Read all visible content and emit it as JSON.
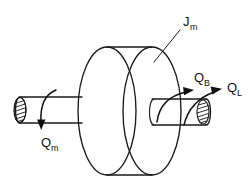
{
  "figure": {
    "name": "rotor-inertia-torque-diagram",
    "background_color": "#ffffff",
    "line_color": "#1a1a1a",
    "width": 251,
    "height": 187
  },
  "labels": {
    "inertia": {
      "symbol": "J",
      "subscript": "m",
      "meaning": "motor-rotor-inertia",
      "x": 183,
      "y": 26,
      "leader_from_x": 181,
      "leader_from_y": 30,
      "leader_to_x": 154,
      "leader_to_y": 62
    },
    "motor_torque": {
      "symbol": "Q",
      "subscript": "m",
      "meaning": "motor-torque",
      "x": 41,
      "y": 147
    },
    "bearing_torque": {
      "symbol": "Q",
      "subscript": "B",
      "meaning": "bearing-friction-torque",
      "x": 194,
      "y": 82
    },
    "load_torque": {
      "symbol": "Q",
      "subscript": "L",
      "meaning": "load-torque",
      "x": 227,
      "y": 92
    }
  },
  "geometry": {
    "rotor_back_ellipse": {
      "cx": 107,
      "cy": 111,
      "rx": 29,
      "ry": 64
    },
    "rotor_front_ellipse": {
      "cx": 152,
      "cy": 111,
      "rx": 29,
      "ry": 64
    },
    "left_shaft": {
      "x1": 16,
      "y1": 97,
      "x2": 80,
      "y2": 123
    },
    "right_shaft": {
      "x1": 152,
      "y1": 99,
      "x2": 212,
      "y2": 125
    },
    "left_shaft_end_cap": {
      "cx": 20,
      "cy": 110,
      "rx": 6,
      "ry": 13,
      "hatched": true
    },
    "right_shaft_end_cap": {
      "cx": 204,
      "cy": 112,
      "rx": 6,
      "ry": 12,
      "hatched": true
    }
  },
  "arrows": [
    {
      "name": "motor-torque-arrow",
      "direction": "downward",
      "curved": true
    },
    {
      "name": "bearing-torque-arrow",
      "direction": "upward-right",
      "curved": true
    },
    {
      "name": "load-torque-arrow",
      "direction": "upward-right",
      "curved": true
    }
  ]
}
